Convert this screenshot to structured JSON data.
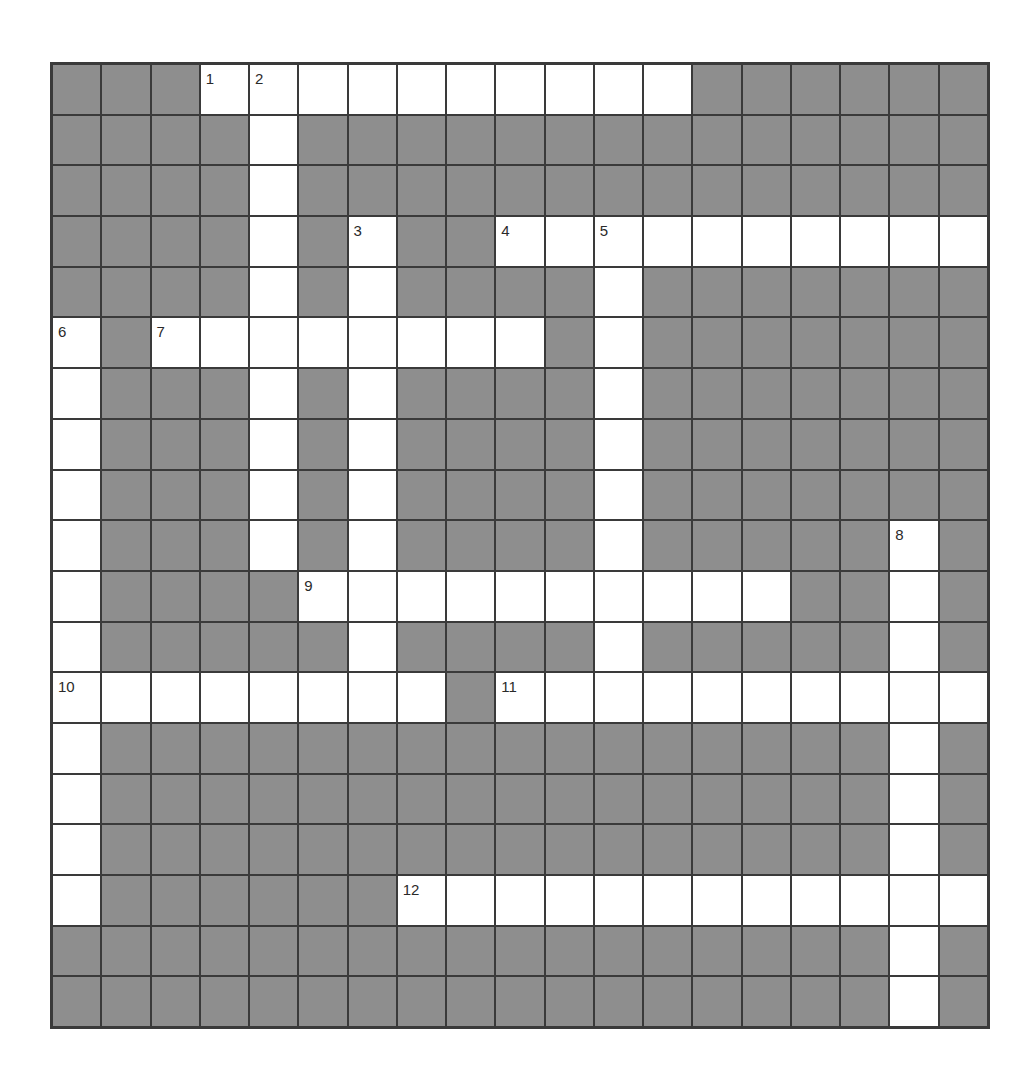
{
  "puzzle": {
    "rows": 19,
    "cols": 19,
    "colors": {
      "block": "#8e8e8e",
      "open": "#ffffff",
      "line": "#3a3a3a"
    },
    "grid": [
      "###..........######",
      "####.##############",
      "####.##############",
      "####.#.##..........",
      "####.#.####.#######",
      ".#........#.#######",
      ".###.#.####.#######",
      ".###.#.####.#######",
      ".###.#.####.#######",
      ".###.#.####.#####.#",
      ".####..........##.#",
      ".#####.####.#####.#",
      "........#..........",
      ".################.#",
      ".################.#",
      ".################.#",
      ".######............",
      "#################.#",
      "#################.#"
    ],
    "numbers": [
      {
        "n": "1",
        "r": 0,
        "c": 3
      },
      {
        "n": "2",
        "r": 0,
        "c": 4
      },
      {
        "n": "3",
        "r": 3,
        "c": 6
      },
      {
        "n": "4",
        "r": 3,
        "c": 9
      },
      {
        "n": "5",
        "r": 3,
        "c": 11
      },
      {
        "n": "6",
        "r": 5,
        "c": 0
      },
      {
        "n": "7",
        "r": 5,
        "c": 2
      },
      {
        "n": "8",
        "r": 9,
        "c": 17
      },
      {
        "n": "9",
        "r": 10,
        "c": 5
      },
      {
        "n": "10",
        "r": 12,
        "c": 0
      },
      {
        "n": "11",
        "r": 12,
        "c": 9
      },
      {
        "n": "12",
        "r": 16,
        "c": 7
      }
    ]
  }
}
